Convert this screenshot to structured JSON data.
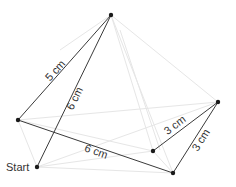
{
  "diagram": {
    "colors": {
      "line": "#3a3a3a",
      "ghost": "#e4e4e4",
      "point": "#1a1a1a",
      "text": "#333333"
    },
    "points": {
      "top": [
        111,
        15
      ],
      "left": [
        18,
        120
      ],
      "start": [
        37,
        167
      ],
      "right": [
        218,
        102
      ],
      "mid": [
        153,
        151
      ],
      "bottom": [
        173,
        173
      ]
    },
    "start_label": "Start",
    "segments": [
      {
        "from": "left",
        "to": "top",
        "label": "5 cm"
      },
      {
        "from": "start",
        "to": "top",
        "label": "6 cm"
      },
      {
        "from": "left",
        "to": "bottom",
        "label": "6 cm"
      },
      {
        "from": "mid",
        "to": "right",
        "label": "3 cm"
      },
      {
        "from": "bottom",
        "to": "right",
        "label": "3 cm"
      }
    ]
  }
}
